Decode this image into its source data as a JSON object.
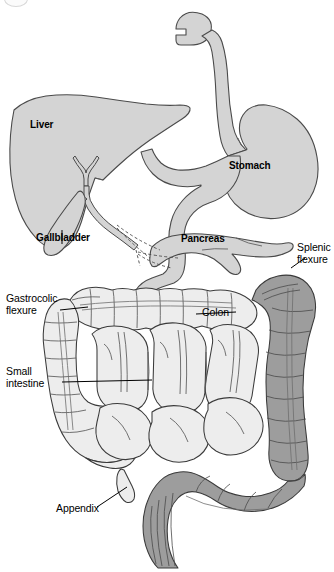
{
  "figure": {
    "kind": "anatomical-illustration",
    "background_color": "#ffffff",
    "outline_color": "#3a3a3a",
    "organ_fill_color": "#d4d4d4",
    "small_intestine_fill_color": "#ededed",
    "distal_colon_fill_color": "#9d9d9d"
  },
  "labels": {
    "liver": "Liver",
    "gallbladder": "Gallbladder",
    "stomach": "Stomach",
    "pancreas": "Pancreas",
    "splenic_flexure": "Splenic\nflexure",
    "gastrocolic_flexure": "Gastrocolic\nflexure",
    "colon": "Colon",
    "small_intestine": "Small\nintestine",
    "appendix": "Appendix"
  },
  "structures": [
    {
      "name": "esophagus",
      "label_shown": false,
      "fill": "#d4d4d4"
    },
    {
      "name": "stomach",
      "label_shown": true,
      "fill": "#d4d4d4"
    },
    {
      "name": "liver",
      "label_shown": true,
      "fill": "#d4d4d4"
    },
    {
      "name": "gallbladder",
      "label_shown": true,
      "fill": "#d4d4d4"
    },
    {
      "name": "pancreas",
      "label_shown": true,
      "fill": "#d4d4d4"
    },
    {
      "name": "duodenum",
      "label_shown": false,
      "fill": "#d4d4d4"
    },
    {
      "name": "bile-duct",
      "label_shown": false,
      "fill": "#d4d4d4"
    },
    {
      "name": "pancreatic-duct",
      "label_shown": false,
      "fill": "none"
    },
    {
      "name": "transverse-colon",
      "label_shown": true,
      "fill": "#ededed"
    },
    {
      "name": "ascending-colon",
      "label_shown": false,
      "fill": "#ededed"
    },
    {
      "name": "gastrocolic-flexure",
      "label_shown": true,
      "fill": "#ededed"
    },
    {
      "name": "splenic-flexure",
      "label_shown": true,
      "fill": "#9d9d9d"
    },
    {
      "name": "descending-colon",
      "label_shown": false,
      "fill": "#9d9d9d"
    },
    {
      "name": "sigmoid-colon",
      "label_shown": false,
      "fill": "#9d9d9d"
    },
    {
      "name": "rectum",
      "label_shown": false,
      "fill": "#9d9d9d"
    },
    {
      "name": "small-intestine",
      "label_shown": true,
      "fill": "#ededed"
    },
    {
      "name": "cecum",
      "label_shown": false,
      "fill": "#ededed"
    },
    {
      "name": "appendix",
      "label_shown": true,
      "fill": "#ededed"
    }
  ]
}
